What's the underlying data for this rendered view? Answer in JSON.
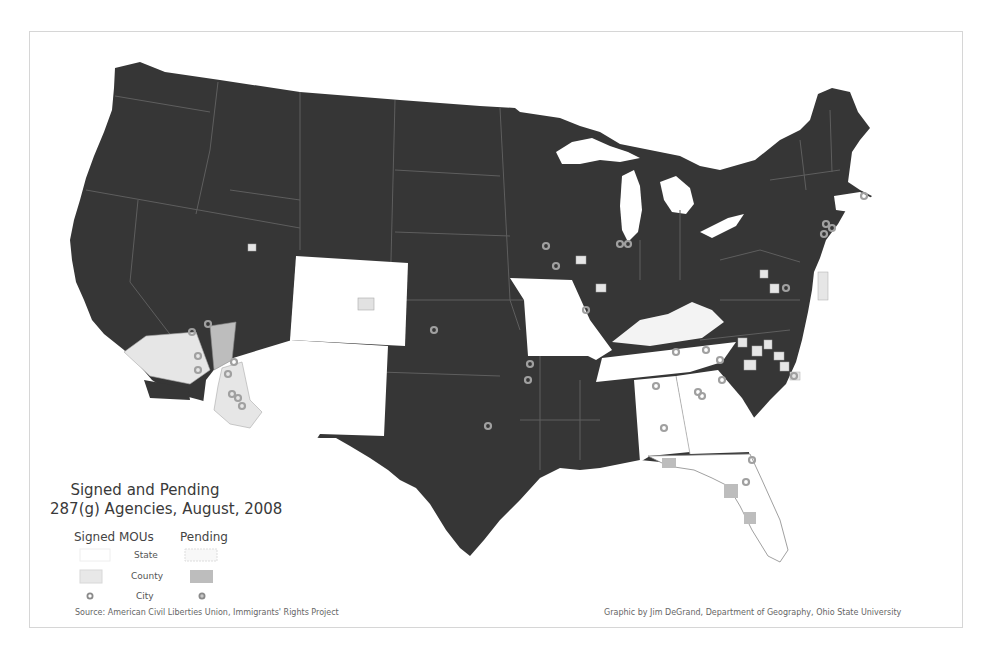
{
  "map": {
    "title_line1": "Signed and Pending",
    "title_line2": "287(g) Agencies, August, 2008",
    "colors": {
      "no_agreement": "#363636",
      "signed_state": "#ffffff",
      "signed_county": "#e6e6e6",
      "pending_state": "#f6f6f6",
      "pending_county": "#bdbdbd",
      "city_marker": "#9a9a9a",
      "border": "#5e5e5e"
    },
    "signed_states": [
      "Colorado",
      "Arizona",
      "New Mexico",
      "Missouri",
      "Tennessee",
      "Alabama",
      "Georgia",
      "Florida",
      "Massachusetts"
    ],
    "pending_states": [
      "Kentucky"
    ]
  },
  "legend": {
    "signed_header": "Signed MOUs",
    "pending_header": "Pending",
    "rows": [
      {
        "label": "State"
      },
      {
        "label": "County"
      },
      {
        "label": "City"
      }
    ]
  },
  "credits": {
    "source": "Source: American Civil Liberties Union, Immigrants' Rights Project",
    "graphic": "Graphic by Jim DeGrand, Department of Geography, Ohio State University"
  }
}
